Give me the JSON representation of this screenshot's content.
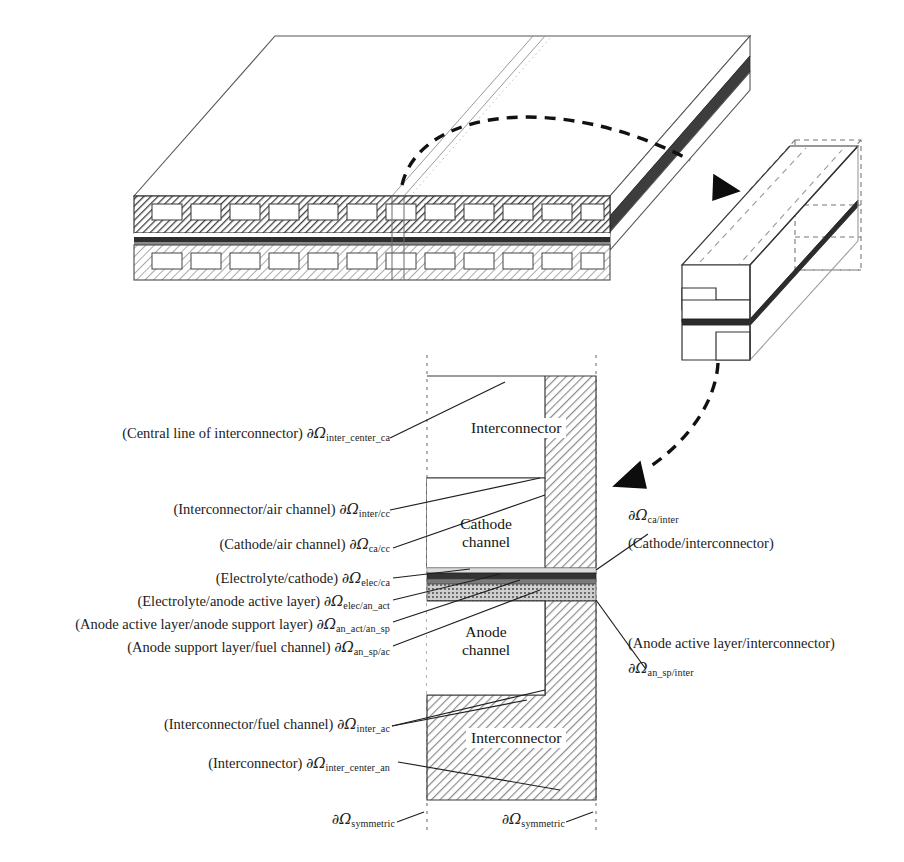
{
  "figure": {
    "top_view": {
      "name": "Planar SOFC stack 3D view",
      "layers": [
        "cathode-side interconnector with air channels",
        "cell layer stack",
        "anode-side interconnector with fuel channels"
      ]
    },
    "detail_view": {
      "name": "Repeating unit cell 3D detail"
    },
    "cross_section": {
      "interconnector_top_label": "Interconnector",
      "interconnector_bottom_label": "Interconnector",
      "cathode_channel_label": "Cathode\nchannel",
      "cathode_channel_line1": "Cathode",
      "cathode_channel_line2": "channel",
      "anode_channel_line1": "Anode",
      "anode_channel_line2": "channel"
    },
    "labels_left": [
      {
        "id": "inter-center-ca",
        "text": "(Central line of interconnector) ",
        "symbol": "∂Ω",
        "subscript": "inter_center_ca"
      },
      {
        "id": "inter-cc",
        "text": "(Interconnector/air channel) ",
        "symbol": "∂Ω",
        "subscript": "inter/cc"
      },
      {
        "id": "ca-cc",
        "text": "(Cathode/air channel) ",
        "symbol": "∂Ω",
        "subscript": "ca/cc"
      },
      {
        "id": "elec-ca",
        "text": "(Electrolyte/cathode) ",
        "symbol": "∂Ω",
        "subscript": "elec/ca"
      },
      {
        "id": "elec-an-act",
        "text": "(Electrolyte/anode active layer) ",
        "symbol": "∂Ω",
        "subscript": "elec/an_act"
      },
      {
        "id": "an-act-an-sp",
        "text": "(Anode active layer/anode support layer) ",
        "symbol": "∂Ω",
        "subscript": "an_act/an_sp"
      },
      {
        "id": "an-sp-ac",
        "text": "(Anode support layer/fuel channel) ",
        "symbol": "∂Ω",
        "subscript": "an_sp/ac"
      },
      {
        "id": "inter-ac",
        "text": "(Interconnector/fuel channel) ",
        "symbol": "∂Ω",
        "subscript": "inter_ac"
      },
      {
        "id": "inter-center-an",
        "text": "(Interconnector) ",
        "symbol": "∂Ω",
        "subscript": "inter_center_an"
      }
    ],
    "labels_right": [
      {
        "id": "ca-inter",
        "symbol": "∂Ω",
        "subscript": "ca/inter",
        "text": "(Cathode/interconnector)"
      },
      {
        "id": "an-sp-inter",
        "text": "(Anode active layer/interconnector)",
        "symbol": "∂Ω",
        "subscript": "an_sp/inter"
      }
    ],
    "labels_bottom": [
      {
        "id": "symmetric-left",
        "symbol": "∂Ω",
        "subscript": "symmetric"
      },
      {
        "id": "symmetric-right",
        "symbol": "∂Ω",
        "subscript": "symmetric"
      }
    ],
    "colors": {
      "line": "#1a1a1a",
      "hatch": "#8c8c8c",
      "interconnector_fill": "#c9c9c9",
      "cathode_layer": "#d8d8d8",
      "electrolyte_layer": "#3a3a3a",
      "anode_active_layer": "#707070",
      "anode_support_layer": "#a8a8a8",
      "background": "#ffffff"
    }
  }
}
